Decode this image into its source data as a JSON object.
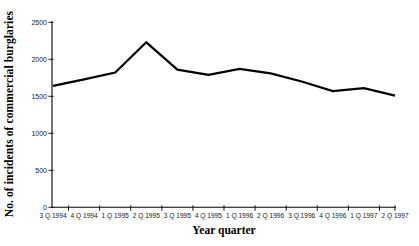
{
  "figure": {
    "background": "#ffffff",
    "axis_color": "#000000"
  },
  "chart_data": {
    "type": "line",
    "categories": [
      "3 Q 1994",
      "4 Q 1994",
      "1 Q 1995",
      "2 Q 1995",
      "3 Q 1995",
      "4 Q 1995",
      "1 Q 1996",
      "2 Q 1996",
      "3 Q 1996",
      "4 Q 1996",
      "1 Q 1997",
      "2 Q 1997"
    ],
    "values": [
      1640,
      1730,
      1820,
      2230,
      1860,
      1790,
      1870,
      1810,
      1700,
      1570,
      1610,
      1510
    ],
    "xlabel": "Year quarter",
    "ylabel": "No. of incidents of commercial burglaries",
    "ylim": [
      0,
      2500
    ],
    "y_ticks": [
      0,
      500,
      1000,
      1500,
      2000,
      2500
    ],
    "grid": false,
    "legend": "none",
    "line_color": "#000000"
  }
}
